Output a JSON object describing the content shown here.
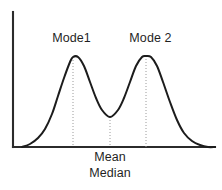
{
  "figure": {
    "background_color": "#ffffff",
    "line_color": "#1c1c1c",
    "axis_color": "#2b2b2b",
    "guide_color": "#9a9a9a"
  },
  "labels": {
    "mode1": "Mode1",
    "mode2": "Mode 2",
    "mean": "Mean",
    "median": "Median"
  },
  "chart_data": {
    "type": "line",
    "title": "",
    "subtitle": "",
    "xlabel": "",
    "ylabel": "",
    "grid": false,
    "legend_position": "none",
    "xlim": [
      13,
      215
    ],
    "ylim": [
      0,
      135
    ],
    "axes": {
      "y_axis": {
        "x": 13,
        "y_top": 12,
        "y_bottom": 147
      },
      "x_axis": {
        "y": 147,
        "x_left": 13,
        "x_right": 215
      }
    },
    "series": [
      {
        "name": "density",
        "points": [
          [
            22,
            147
          ],
          [
            30,
            144
          ],
          [
            38,
            138
          ],
          [
            45,
            129
          ],
          [
            52,
            114
          ],
          [
            58,
            96
          ],
          [
            64,
            78
          ],
          [
            70,
            62
          ],
          [
            73,
            57
          ],
          [
            78,
            57
          ],
          [
            84,
            66
          ],
          [
            90,
            82
          ],
          [
            96,
            98
          ],
          [
            102,
            110
          ],
          [
            110,
            117
          ],
          [
            118,
            110
          ],
          [
            124,
            98
          ],
          [
            130,
            82
          ],
          [
            136,
            66
          ],
          [
            142,
            57
          ],
          [
            146,
            56
          ],
          [
            151,
            57
          ],
          [
            157,
            66
          ],
          [
            163,
            82
          ],
          [
            170,
            102
          ],
          [
            177,
            120
          ],
          [
            184,
            133
          ],
          [
            192,
            141
          ],
          [
            200,
            145
          ],
          [
            208,
            147
          ],
          [
            215,
            147
          ]
        ]
      }
    ],
    "annotations": [
      {
        "label": "Mode1",
        "kind": "mode",
        "x": 73,
        "y_curve": 57,
        "guide_line": {
          "x": 73,
          "y_top": 57,
          "y_bottom": 147
        },
        "text_center_x": 71,
        "text_baseline_y": 45
      },
      {
        "label": "Mean",
        "kind": "center",
        "x": 110,
        "y_curve": 117,
        "guide_line": {
          "x": 110,
          "y_top": 117,
          "y_bottom": 147
        },
        "text_center_x": 110,
        "text_baseline_y": 163
      },
      {
        "label": "Median",
        "kind": "center",
        "x": 110,
        "y_curve": 117,
        "guide_line": {
          "x": 110,
          "y_top": 117,
          "y_bottom": 147
        },
        "text_center_x": 110,
        "text_baseline_y": 179
      },
      {
        "label": "Mode 2",
        "kind": "mode",
        "x": 146,
        "y_curve": 56,
        "guide_line": {
          "x": 146,
          "y_top": 56,
          "y_bottom": 147
        },
        "text_center_x": 150,
        "text_baseline_y": 45
      }
    ]
  }
}
